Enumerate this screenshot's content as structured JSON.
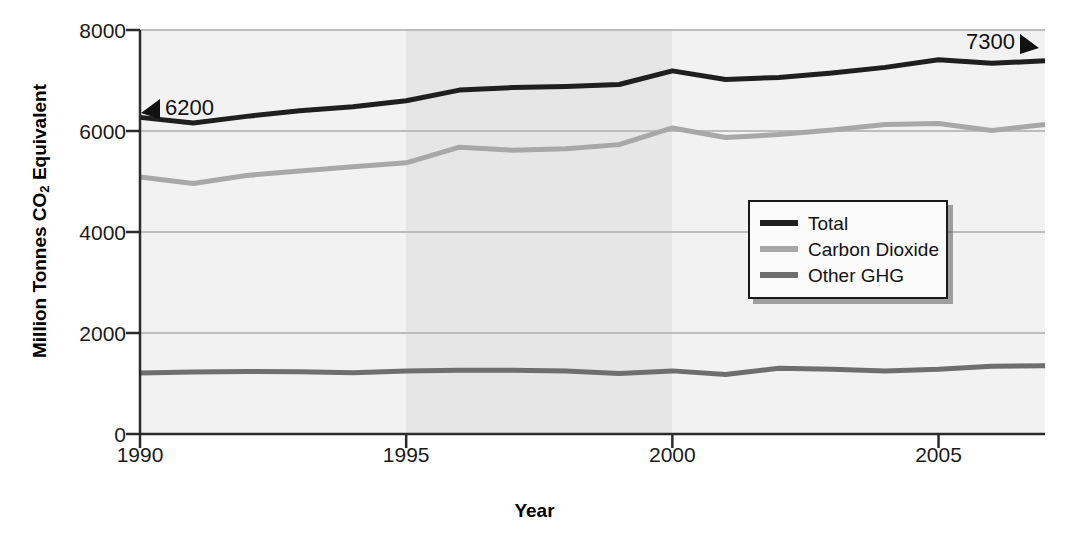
{
  "chart_data": {
    "type": "line",
    "title": "",
    "xlabel": "Year",
    "ylabel": "Million Tonnes CO2 Equivalent",
    "ylabel_prefix": "Million Tonnes CO",
    "ylabel_sub": "2",
    "ylabel_suffix": " Equivalent",
    "x": [
      1990,
      1991,
      1992,
      1993,
      1994,
      1995,
      1996,
      1997,
      1998,
      1999,
      2000,
      2001,
      2002,
      2003,
      2004,
      2005,
      2006,
      2007
    ],
    "xlim": [
      1990,
      2007
    ],
    "ylim": [
      0,
      8000
    ],
    "xticks": [
      1990,
      1995,
      2000,
      2005
    ],
    "yticks": [
      0,
      2000,
      4000,
      6000,
      8000
    ],
    "ytick_labels": [
      "0",
      "2000",
      "4000",
      "6000",
      "8000"
    ],
    "xtick_labels": [
      "1990",
      "1995",
      "2000",
      "2005"
    ],
    "grid": true,
    "legend_position": "center-right",
    "series": [
      {
        "name": "Total",
        "color": "#1f1f1f",
        "width": 5,
        "values": [
          6270,
          6160,
          6290,
          6400,
          6480,
          6600,
          6810,
          6860,
          6880,
          6920,
          7190,
          7020,
          7060,
          7150,
          7260,
          7410,
          7340,
          7390
        ]
      },
      {
        "name": "Carbon Dioxide",
        "color": "#a8a8a8",
        "width": 5,
        "values": [
          5090,
          4960,
          5120,
          5210,
          5290,
          5370,
          5680,
          5620,
          5650,
          5730,
          6060,
          5870,
          5930,
          6020,
          6130,
          6150,
          6010,
          6130
        ]
      },
      {
        "name": "Other GHG",
        "color": "#6e6e6e",
        "width": 5,
        "values": [
          1210,
          1230,
          1240,
          1235,
          1215,
          1250,
          1260,
          1260,
          1250,
          1200,
          1250,
          1180,
          1300,
          1280,
          1250,
          1280,
          1340,
          1350
        ]
      }
    ],
    "annotations": [
      {
        "text": "6200",
        "value": 6270,
        "year": 1990,
        "marker": "left-arrow"
      },
      {
        "text": "7300",
        "value": 7390,
        "year": 2007,
        "marker": "right-arrow"
      }
    ],
    "shaded_bands": [
      {
        "from": 1995,
        "to": 2000,
        "color": "#e6e6e6"
      }
    ],
    "plot_background": "#f2f2f2"
  },
  "legend": {
    "items": [
      {
        "label": "Total",
        "color": "#1f1f1f"
      },
      {
        "label": "Carbon Dioxide",
        "color": "#a8a8a8"
      },
      {
        "label": "Other GHG",
        "color": "#6e6e6e"
      }
    ]
  }
}
